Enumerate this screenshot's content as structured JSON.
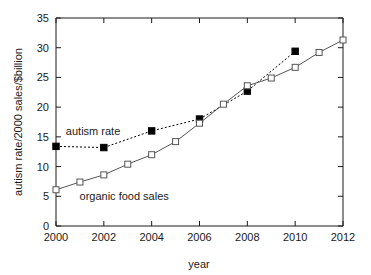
{
  "chart_data": {
    "type": "line",
    "title": "",
    "xlabel": "year",
    "ylabel": "autism rate/2000  sales/$billion",
    "xlim": [
      2000,
      2012
    ],
    "ylim": [
      0,
      35
    ],
    "xticks": [
      "2000",
      "2002",
      "2004",
      "2006",
      "2008",
      "2010",
      "2012"
    ],
    "xtick_values": [
      2000,
      2002,
      2004,
      2006,
      2008,
      2010,
      2012
    ],
    "yticks": [
      "0",
      "5",
      "10",
      "15",
      "20",
      "25",
      "30",
      "35"
    ],
    "ytick_values": [
      0,
      5,
      10,
      15,
      20,
      25,
      30,
      35
    ],
    "grid": false,
    "legend": "inline-annotations",
    "series": [
      {
        "name": "autism rate",
        "annotation": "autism rate",
        "marker": "filled-square",
        "linestyle": "dashed",
        "color": "#000000",
        "x": [
          2000,
          2002,
          2004,
          2006,
          2008,
          2010
        ],
        "values": [
          13.4,
          13.2,
          16.0,
          18.0,
          22.7,
          29.4
        ]
      },
      {
        "name": "organic food sales",
        "annotation": "organic food sales",
        "marker": "open-square",
        "linestyle": "solid",
        "color": "#555555",
        "x": [
          2000,
          2001,
          2002,
          2003,
          2004,
          2005,
          2006,
          2007,
          2008,
          2009,
          2010,
          2011,
          2012
        ],
        "values": [
          6.1,
          7.4,
          8.6,
          10.4,
          12.0,
          14.2,
          17.3,
          20.5,
          23.6,
          24.9,
          26.7,
          29.2,
          31.3
        ]
      }
    ],
    "annotations": [
      {
        "text": "autism rate",
        "x": 2001.55,
        "y": 15.3
      },
      {
        "text": "organic food sales",
        "x": 2002.85,
        "y": 4.4
      }
    ]
  }
}
